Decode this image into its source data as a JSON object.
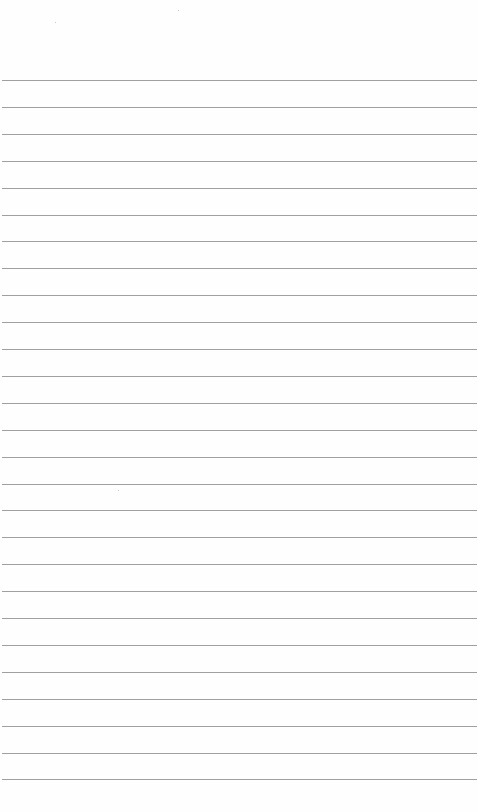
{
  "page": {
    "type": "lined-paper",
    "background": "#fefefe",
    "rule_color": "#8f8f8f",
    "rule_count": 27,
    "first_rule_y": 80,
    "rule_spacing": 26.9,
    "rule_left": 2,
    "rule_width": 475
  }
}
